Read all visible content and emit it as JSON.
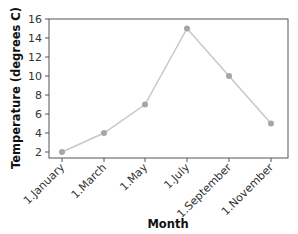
{
  "chart_data": {
    "type": "line",
    "title": "",
    "xlabel": "Month",
    "ylabel": "Temperature (degrees C)",
    "categories": [
      "1.January",
      "1.March",
      "1.May",
      "1.July",
      "1.September",
      "1.November"
    ],
    "series": [
      {
        "name": "Temperature",
        "values": [
          2,
          4,
          7,
          15,
          10,
          5
        ],
        "color": "#a6a6a6",
        "line_color": "#c8c8c8"
      }
    ],
    "yticks": [
      2,
      4,
      6,
      8,
      10,
      12,
      14,
      16
    ],
    "ylim": [
      2,
      16
    ],
    "grid": false,
    "legend": "none"
  }
}
